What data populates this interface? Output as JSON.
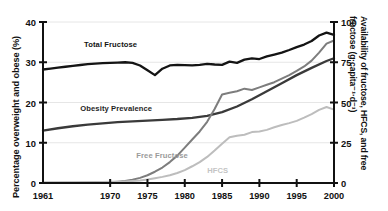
{
  "chart_data": {
    "type": "line",
    "title": "",
    "xlabel": "",
    "ylabel": "Percentage overweight and obese (%)",
    "y2label": "Availability of fructose, HFCS, and free fructose (g·capita⁻¹·d⁻¹)",
    "xlim": [
      1961,
      2000
    ],
    "ylim": [
      0,
      40
    ],
    "y2lim": [
      0,
      100
    ],
    "grid": true,
    "grid_axis": "y",
    "legend": "inline-annotations",
    "xticks": [
      1961,
      1970,
      1975,
      1980,
      1985,
      1990,
      1995,
      2000
    ],
    "xticklabels": [
      "1961",
      "1970",
      "1975",
      "1980",
      "1985",
      "1990",
      "1995",
      "2000"
    ],
    "yticks": [
      0,
      10,
      20,
      30,
      40
    ],
    "yticklabels": [
      "0",
      "10",
      "20",
      "30",
      "40"
    ],
    "y2ticks": [
      0,
      25,
      50,
      75,
      100
    ],
    "y2ticklabels": [
      "0",
      "25",
      "50",
      "75",
      "100"
    ],
    "series": [
      {
        "name": "Total Fructose",
        "axis": "right",
        "color": "#141414",
        "width": 2.3,
        "x": [
          1961,
          1962,
          1963,
          1964,
          1965,
          1966,
          1967,
          1968,
          1969,
          1970,
          1971,
          1972,
          1973,
          1974,
          1975,
          1976,
          1977,
          1978,
          1979,
          1980,
          1981,
          1982,
          1983,
          1984,
          1985,
          1986,
          1987,
          1988,
          1989,
          1990,
          1991,
          1992,
          1993,
          1994,
          1995,
          1996,
          1997,
          1998,
          1999,
          2000
        ],
        "values": [
          70.5,
          71.0,
          71.6,
          72.2,
          72.8,
          73.3,
          73.8,
          74.2,
          74.4,
          74.6,
          74.8,
          75.0,
          74.6,
          73.0,
          70.0,
          67.0,
          71.0,
          73.0,
          73.4,
          73.2,
          73.0,
          73.4,
          74.0,
          73.6,
          73.4,
          75.4,
          74.6,
          76.6,
          77.4,
          77.0,
          78.6,
          79.8,
          81.0,
          82.6,
          84.4,
          86.0,
          88.2,
          91.6,
          93.4,
          92.0
        ]
      },
      {
        "name": "Obesity Prevalence",
        "axis": "left",
        "color": "#3a3a3a",
        "width": 2.3,
        "x": [
          1961,
          1963,
          1965,
          1967,
          1969,
          1971,
          1973,
          1975,
          1977,
          1979,
          1981,
          1983,
          1985,
          1987,
          1989,
          1991,
          1993,
          1995,
          1997,
          1999,
          2000
        ],
        "values": [
          13.0,
          13.6,
          14.1,
          14.5,
          14.8,
          15.1,
          15.3,
          15.5,
          15.7,
          15.9,
          16.2,
          16.7,
          17.6,
          19.0,
          20.8,
          22.8,
          24.8,
          26.8,
          28.6,
          30.3,
          31.0
        ]
      },
      {
        "name": "HFCS",
        "axis": "right",
        "color": "#7d7d7d",
        "width": 2.0,
        "x": [
          1961,
          1965,
          1967,
          1969,
          1970,
          1971,
          1972,
          1973,
          1974,
          1975,
          1976,
          1977,
          1978,
          1979,
          1980,
          1981,
          1982,
          1983,
          1984,
          1985,
          1986,
          1987,
          1988,
          1989,
          1990,
          1991,
          1992,
          1993,
          1994,
          1995,
          1996,
          1997,
          1998,
          1999,
          2000
        ],
        "values": [
          0.2,
          0.2,
          0.3,
          0.4,
          0.5,
          0.8,
          1.2,
          2.0,
          3.2,
          4.8,
          7.0,
          9.6,
          13.0,
          17.0,
          22.0,
          27.0,
          32.0,
          38.0,
          46.0,
          55.0,
          56.0,
          57.0,
          58.6,
          57.8,
          59.4,
          61.0,
          62.6,
          64.8,
          67.0,
          69.6,
          72.4,
          76.0,
          81.0,
          86.6,
          88.5
        ]
      },
      {
        "name": "Free Fructose",
        "axis": "right",
        "color": "#bdbdbd",
        "width": 2.0,
        "x": [
          1961,
          1965,
          1968,
          1970,
          1972,
          1974,
          1975,
          1976,
          1977,
          1978,
          1979,
          1980,
          1981,
          1982,
          1983,
          1984,
          1985,
          1986,
          1987,
          1988,
          1989,
          1990,
          1991,
          1992,
          1993,
          1994,
          1995,
          1996,
          1997,
          1998,
          1999,
          2000
        ],
        "values": [
          0.3,
          0.4,
          0.5,
          0.7,
          1.0,
          1.6,
          2.2,
          3.0,
          3.8,
          4.8,
          6.2,
          8.0,
          10.4,
          13.0,
          16.2,
          20.2,
          24.4,
          28.4,
          29.4,
          30.0,
          31.6,
          32.0,
          33.0,
          34.6,
          36.0,
          37.2,
          38.6,
          40.6,
          42.8,
          45.4,
          47.2,
          45.6
        ]
      }
    ],
    "annotations": [
      {
        "text": "Total Fructose",
        "color": "#141414",
        "x": 1966.5,
        "y_axis": "right",
        "y": 86.0
      },
      {
        "text": "Obesity Prevalence",
        "color": "#1f1f1f",
        "x": 1966.0,
        "y_axis": "left",
        "y": 18.4
      },
      {
        "text": "Free Fructose",
        "color": "#9a9a9a",
        "x": 1973.5,
        "y_axis": "left",
        "y": 6.6
      },
      {
        "text": "HFCS",
        "color": "#c4c4c4",
        "x": 1983.0,
        "y_axis": "left",
        "y": 3.1
      }
    ]
  },
  "colors": {
    "axis": "#111111",
    "grid": "#e6e6e6",
    "background": "#ffffff",
    "total_fructose": "#141414",
    "obesity_prevalence": "#3a3a3a",
    "hfcs": "#7d7d7d",
    "free_fructose": "#bdbdbd"
  }
}
